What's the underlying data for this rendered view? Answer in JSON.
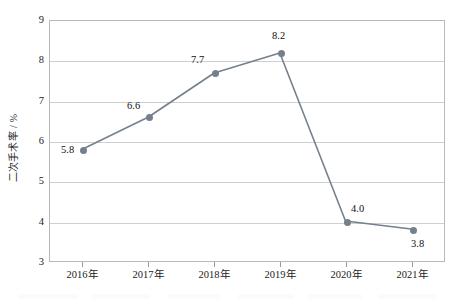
{
  "chart_data": {
    "type": "line",
    "title": "",
    "subtitle": "",
    "xlabel": "",
    "ylabel": "二次手术率 / %",
    "categories": [
      "2016年",
      "2017年",
      "2018年",
      "2019年",
      "2020年",
      "2021年"
    ],
    "values": [
      5.8,
      6.6,
      7.7,
      8.2,
      4.0,
      3.8
    ],
    "point_labels": [
      "5.8",
      "6.6",
      "7.7",
      "8.2",
      "4.0",
      "3.8"
    ],
    "series": [
      {
        "name": "二次手术率",
        "values": [
          5.8,
          6.6,
          7.7,
          8.2,
          4.0,
          3.8
        ]
      }
    ],
    "ylim": [
      3,
      9
    ],
    "yticks": [
      3,
      4,
      5,
      6,
      7,
      8,
      9
    ],
    "ytick_labels": [
      "3",
      "4",
      "5",
      "6",
      "7",
      "8",
      "9"
    ],
    "grid": "horizontal",
    "legend": "none",
    "marker": "circle",
    "colors": {
      "line": "#75808d",
      "marker": "#75808d",
      "gridline": "#cfcfcf",
      "frame": "#b9b9b9",
      "text": "#1a1a1a",
      "background": "#ffffff"
    },
    "label_offsets": [
      {
        "dx": -22,
        "dy": -6
      },
      {
        "dx": -22,
        "dy": -18
      },
      {
        "dx": -24,
        "dy": -19
      },
      {
        "dx": -9,
        "dy": -23
      },
      {
        "dx": 4,
        "dy": -20
      },
      {
        "dx": -2,
        "dy": 7
      }
    ]
  }
}
